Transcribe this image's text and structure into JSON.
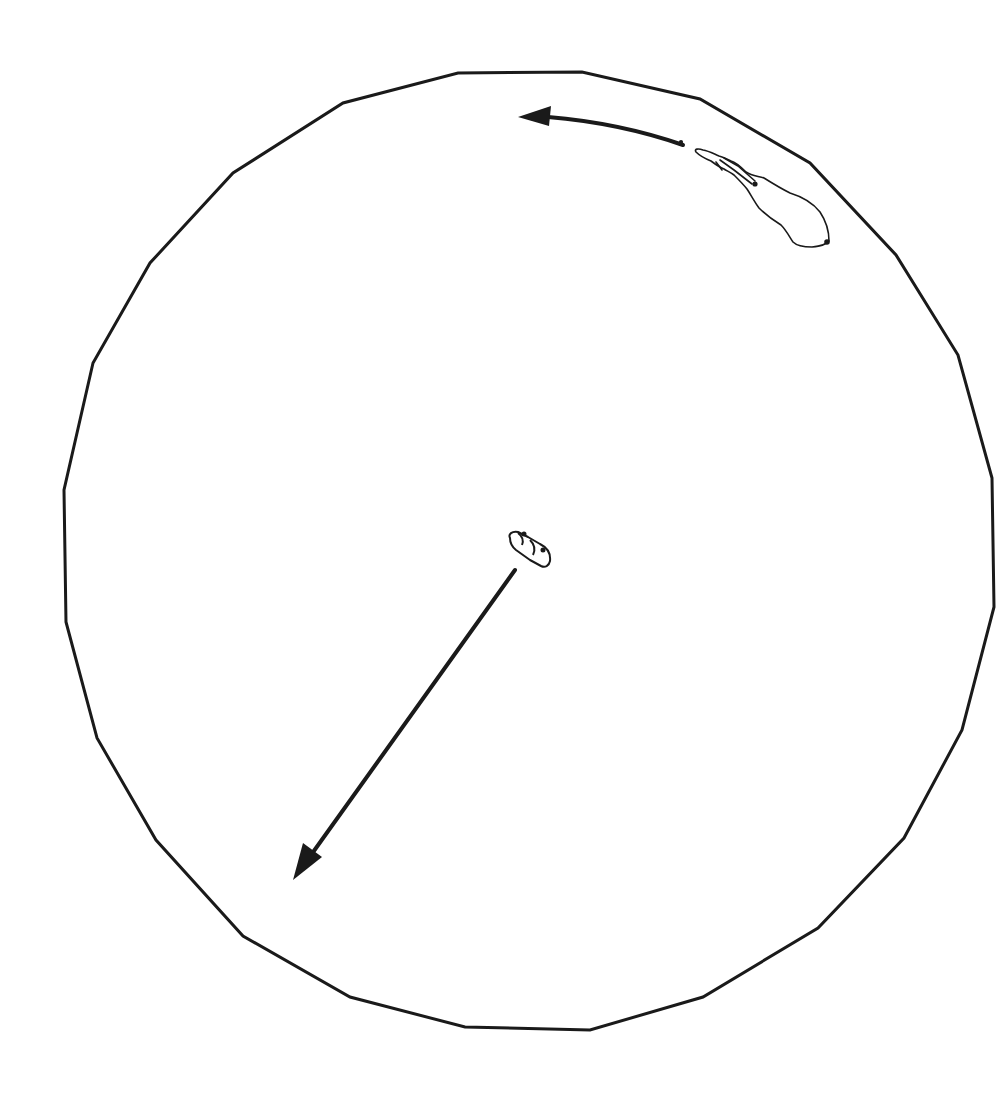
{
  "diagram": {
    "colors": {
      "background": "#ffffff",
      "stroke": "#1a1a1a"
    },
    "arena": {
      "shape": "polygon",
      "sides": 24,
      "stroke_width": 3,
      "vertices": [
        [
          458,
          73
        ],
        [
          582,
          72
        ],
        [
          700,
          99
        ],
        [
          810,
          163
        ],
        [
          896,
          255
        ],
        [
          958,
          355
        ],
        [
          992,
          478
        ],
        [
          994,
          607
        ],
        [
          962,
          730
        ],
        [
          904,
          838
        ],
        [
          818,
          928
        ],
        [
          703,
          997
        ],
        [
          590,
          1030
        ],
        [
          465,
          1027
        ],
        [
          350,
          997
        ],
        [
          243,
          936
        ],
        [
          156,
          840
        ],
        [
          97,
          738
        ],
        [
          66,
          622
        ],
        [
          64,
          490
        ],
        [
          93,
          363
        ],
        [
          150,
          263
        ],
        [
          233,
          173
        ],
        [
          343,
          103
        ]
      ]
    },
    "animal": {
      "label": "animal-outline",
      "position": [
        760,
        195
      ]
    },
    "center_object": {
      "label": "center-object",
      "position": [
        528,
        550
      ]
    },
    "arrows": [
      {
        "name": "curved-arrow",
        "from": [
          683,
          145
        ],
        "to": [
          518,
          116
        ],
        "direction": "counter-clockwise"
      },
      {
        "name": "straight-arrow",
        "from": [
          515,
          570
        ],
        "to": [
          293,
          880
        ],
        "direction": "down-left"
      }
    ]
  }
}
